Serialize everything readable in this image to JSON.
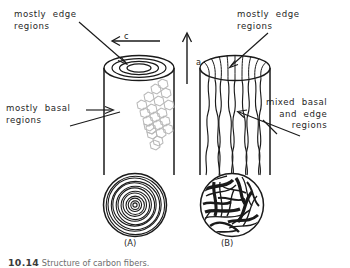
{
  "figure": {
    "caption_number": "10.14",
    "caption_text": "Structure of carbon fibers.",
    "panels": [
      {
        "id": "A",
        "label": "(A)",
        "structure": "onion-skin concentric basal planes"
      },
      {
        "id": "B",
        "label": "(B)",
        "structure": "random mixed basal and edge fibrils"
      }
    ]
  },
  "annotations": {
    "edge_regions_a": "mostly  edge\nregions",
    "basal_regions_a": "mostly  basal\nregions",
    "edge_regions_b": "mostly  edge\nregions",
    "mixed_regions_b": "mixed  basal\nand  edge\nregions"
  },
  "axes": {
    "c_axis_label": "c",
    "a_axis_label": "a"
  },
  "colors": {
    "ink": "#1a1a1a",
    "text": "#262626",
    "hexagon": "#b9b9b9",
    "caption": "#6e6e6e"
  }
}
